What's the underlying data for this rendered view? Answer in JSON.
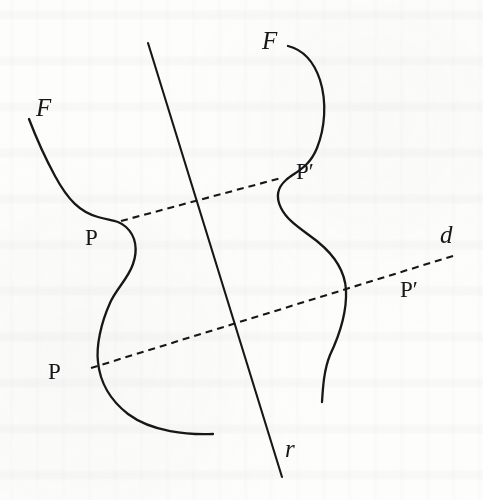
{
  "figure": {
    "kind": "geometry-diagram",
    "background_color": "#fdfdfc",
    "ink_color": "#17171a",
    "stroke_width": 2.1,
    "dash_pattern": "7 5",
    "labels": [
      {
        "id": "F-left",
        "text": "F",
        "style": "italic",
        "x": 36,
        "y": 95,
        "font_size": 25
      },
      {
        "id": "F-right",
        "text": "F",
        "style": "italic",
        "x": 262,
        "y": 28,
        "font_size": 25
      },
      {
        "id": "P-upper",
        "text": "P",
        "style": "roman",
        "x": 85,
        "y": 226,
        "font_size": 23
      },
      {
        "id": "P-lower",
        "text": "P",
        "style": "roman",
        "x": 48,
        "y": 360,
        "font_size": 23
      },
      {
        "id": "Pprime-upper",
        "text": "P′",
        "style": "roman",
        "x": 296,
        "y": 160,
        "font_size": 23
      },
      {
        "id": "Pprime-lower",
        "text": "P′",
        "style": "roman",
        "x": 400,
        "y": 278,
        "font_size": 23
      },
      {
        "id": "d-line",
        "text": "d",
        "style": "italic",
        "x": 440,
        "y": 222,
        "font_size": 25
      },
      {
        "id": "r-line",
        "text": "r",
        "style": "italic",
        "x": 285,
        "y": 436,
        "font_size": 25
      }
    ],
    "axis_of_symmetry": {
      "name": "r",
      "type": "solid-line",
      "start": [
        148,
        43
      ],
      "end": [
        282,
        477
      ]
    },
    "connector_segments": [
      {
        "name": "d-upper",
        "type": "dashed-line",
        "start": [
          121,
          221
        ],
        "end": [
          281,
          178
        ],
        "joins": [
          "P-upper",
          "Pprime-upper"
        ]
      },
      {
        "name": "d-lower",
        "type": "dashed-line",
        "start": [
          91,
          368
        ],
        "end": [
          456,
          255
        ],
        "joins": [
          "P-lower",
          "Pprime-lower"
        ]
      }
    ],
    "curves": [
      {
        "name": "curve-F-left",
        "label": "F",
        "path": "M 29 119 C 37 140 42 152 55 176 C 68 200 80 212 98 217 C 112 221 118 220 126 227 C 136 236 138 250 133 264 C 128 279 116 289 110 303 C 101 323 96 346 98 362 C 100 382 110 400 128 414 C 152 432 188 435 213 434",
        "marked_points": [
          {
            "label": "P",
            "at": [
              123,
              221
            ]
          },
          {
            "label": "P",
            "at": [
              97,
              366
            ]
          }
        ]
      },
      {
        "name": "curve-F-right",
        "label": "F",
        "path": "M 288 46 C 304 50 314 62 320 80 C 327 102 325 128 317 148 C 309 168 295 172 286 180 C 277 188 276 198 281 208 C 288 222 303 230 318 242 C 334 255 345 272 346 290 C 347 312 340 334 330 355 C 324 370 323 386 322 402",
        "marked_points": [
          {
            "label": "P′",
            "at": [
              281,
              180
            ]
          },
          {
            "label": "P′",
            "at": [
              387,
              272
            ]
          }
        ]
      }
    ]
  }
}
